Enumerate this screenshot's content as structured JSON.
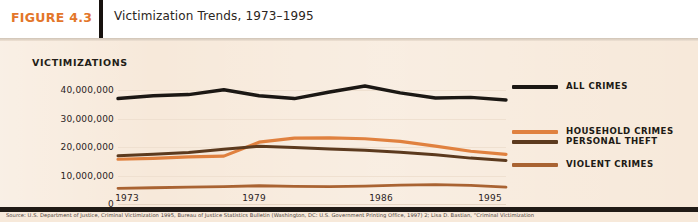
{
  "header": {
    "figure_label": "FIGURE 4.3",
    "title": "Victimization Trends, 1973–1995"
  },
  "colors": {
    "figure_label": "#e3762a",
    "panel_bg": "#f7e9da",
    "all_crimes": "#1b1713",
    "household_crimes": "#e0813f",
    "personal_theft": "#5c3a1e",
    "violent_crimes": "#a96332"
  },
  "axis": {
    "y_title": "VICTIMIZATIONS",
    "y_ticks": [
      "40,000,000",
      "30,000,000",
      "20,000,000",
      "10,000,000",
      "0"
    ],
    "x_ticks": [
      "1973",
      "1979",
      "1986",
      "1995"
    ]
  },
  "legend": [
    {
      "label": "ALL CRIMES",
      "color": "#1b1713"
    },
    {
      "label": "HOUSEHOLD CRIMES",
      "color": "#e0813f"
    },
    {
      "label": "PERSONAL THEFT",
      "color": "#5c3a1e"
    },
    {
      "label": "VIOLENT CRIMES",
      "color": "#a96332"
    }
  ],
  "footer": {
    "source": "Source: U.S. Department of Justice, Criminal Victimization 1995, Bureau of Justice Statistics Bulletin (Washington, DC: U.S. Government Printing Office, 1997) 2; Lisa D. Bastian, “Criminal Victimization"
  },
  "chart_data": {
    "type": "line",
    "title": "Victimization Trends, 1973–1995",
    "xlabel": "",
    "ylabel": "VICTIMIZATIONS",
    "xlim": [
      1973,
      1995
    ],
    "ylim": [
      0,
      44000000
    ],
    "yticks": [
      0,
      10000000,
      20000000,
      30000000,
      40000000
    ],
    "xticks": [
      1973,
      1979,
      1986,
      1995
    ],
    "grid": true,
    "legend_position": "right",
    "x": [
      1973,
      1975,
      1977,
      1979,
      1981,
      1983,
      1985,
      1987,
      1989,
      1991,
      1993,
      1995
    ],
    "series": [
      {
        "name": "ALL CRIMES",
        "color": "#1b1713",
        "values": [
          37000000,
          38000000,
          38400000,
          40100000,
          38000000,
          37000000,
          39300000,
          41400000,
          39000000,
          37200000,
          37400000,
          36500000
        ]
      },
      {
        "name": "HOUSEHOLD CRIMES",
        "color": "#e0813f",
        "values": [
          15700000,
          16000000,
          16500000,
          16800000,
          21700000,
          23100000,
          23200000,
          22900000,
          22000000,
          20300000,
          18500000,
          17400000
        ]
      },
      {
        "name": "PERSONAL THEFT",
        "color": "#5c3a1e",
        "values": [
          16900000,
          17500000,
          18100000,
          19200000,
          20300000,
          19800000,
          19300000,
          18900000,
          18200000,
          17300000,
          16100000,
          15300000
        ]
      },
      {
        "name": "VIOLENT CRIMES",
        "color": "#a96332",
        "values": [
          5500000,
          5700000,
          5900000,
          6100000,
          6400000,
          6200000,
          6100000,
          6300000,
          6600000,
          6800000,
          6500000,
          5900000
        ]
      }
    ]
  }
}
